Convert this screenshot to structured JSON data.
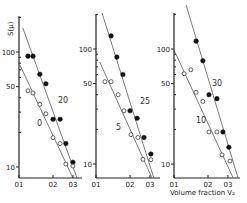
{
  "chart_data": [
    {
      "type": "scatter",
      "scale": "log-log",
      "ylabel": "S(µ)",
      "xlabel": "",
      "xticks": [
        "01",
        "02",
        "03"
      ],
      "yticks": [
        "100",
        "50",
        "10"
      ],
      "xlim": [
        0.1,
        0.33
      ],
      "series": [
        {
          "name": "20",
          "marker": "filled-circle",
          "x": [
            0.12,
            0.133,
            0.153,
            0.173,
            0.2,
            0.231,
            0.26,
            0.3
          ],
          "y": [
            92,
            92,
            64,
            53,
            26,
            26,
            16,
            11
          ],
          "fit": [
            [
              0.108,
              162
            ],
            [
              0.326,
              8.0
            ]
          ]
        },
        {
          "name": "0",
          "marker": "open-circle",
          "x": [
            0.12,
            0.133,
            0.153,
            0.173,
            0.2,
            0.231,
            0.26,
            0.3
          ],
          "y": [
            46,
            44,
            35,
            29,
            18,
            16,
            10.6,
            10.2
          ],
          "fit": [
            [
              0.102,
              77
            ],
            [
              0.3,
              8.0
            ]
          ]
        }
      ]
    },
    {
      "type": "scatter",
      "scale": "log-log",
      "xticks": [
        "01",
        "02",
        "03"
      ],
      "yticks": [
        "100",
        "50",
        "10"
      ],
      "series": [
        {
          "name": "25",
          "marker": "filled-circle",
          "x": [
            0.136,
            0.153,
            0.173,
            0.2,
            0.231,
            0.266,
            0.306
          ],
          "y": [
            130,
            85,
            60,
            29,
            25,
            17,
            12.2
          ],
          "fit": [
            [
              0.113,
              206
            ],
            [
              0.324,
              7.6
            ]
          ]
        },
        {
          "name": "5",
          "marker": "open-circle",
          "x": [
            0.12,
            0.136,
            0.157,
            0.177,
            0.204,
            0.235,
            0.26,
            0.306
          ],
          "y": [
            52,
            52,
            40,
            29,
            18,
            17,
            11,
            10.9
          ],
          "fit": [
            [
              0.108,
              77
            ],
            [
              0.312,
              7.6
            ]
          ]
        }
      ]
    },
    {
      "type": "scatter",
      "scale": "log-log",
      "xlabel": "Volume fraction V₂",
      "xticks": [
        "01",
        "02",
        "03"
      ],
      "yticks": [
        "100",
        "50",
        "10"
      ],
      "series": [
        {
          "name": "30",
          "marker": "filled-circle",
          "x": [
            0.157,
            0.18,
            0.204,
            0.24,
            0.271,
            0.306
          ],
          "y": [
            117,
            79,
            40,
            37,
            19,
            14
          ],
          "fit": [
            [
              0.128,
              241
            ],
            [
              0.368,
              7.6
            ]
          ]
        },
        {
          "name": "10",
          "marker": "open-circle",
          "x": [
            0.123,
            0.141,
            0.157,
            0.18,
            0.204,
            0.24,
            0.266,
            0.313
          ],
          "y": [
            61,
            66,
            42,
            35,
            19,
            19,
            12,
            10.6
          ],
          "fit": [
            [
              0.1,
              98
            ],
            [
              0.333,
              7.6
            ]
          ]
        }
      ]
    }
  ],
  "layout": {
    "panels": [
      {
        "x0": 19,
        "y100": 52,
        "axisTop": 16,
        "axisBottom": 178,
        "xRight": 82,
        "labelPos": [
          [
            58,
            103
          ],
          [
            37,
            126
          ]
        ]
      },
      {
        "x0": 96,
        "y100": 49,
        "axisTop": 14,
        "axisBottom": 178,
        "xRight": 160,
        "labelPos": [
          [
            140,
            104
          ],
          [
            116,
            130
          ]
        ]
      },
      {
        "x0": 174,
        "y100": 49,
        "axisTop": 13,
        "axisBottom": 178,
        "xRight": 240,
        "labelPos": [
          [
            212,
            86
          ],
          [
            196,
            123
          ]
        ]
      }
    ],
    "pxPerDecadeX": 113,
    "pxPerDecadeY": 115
  }
}
